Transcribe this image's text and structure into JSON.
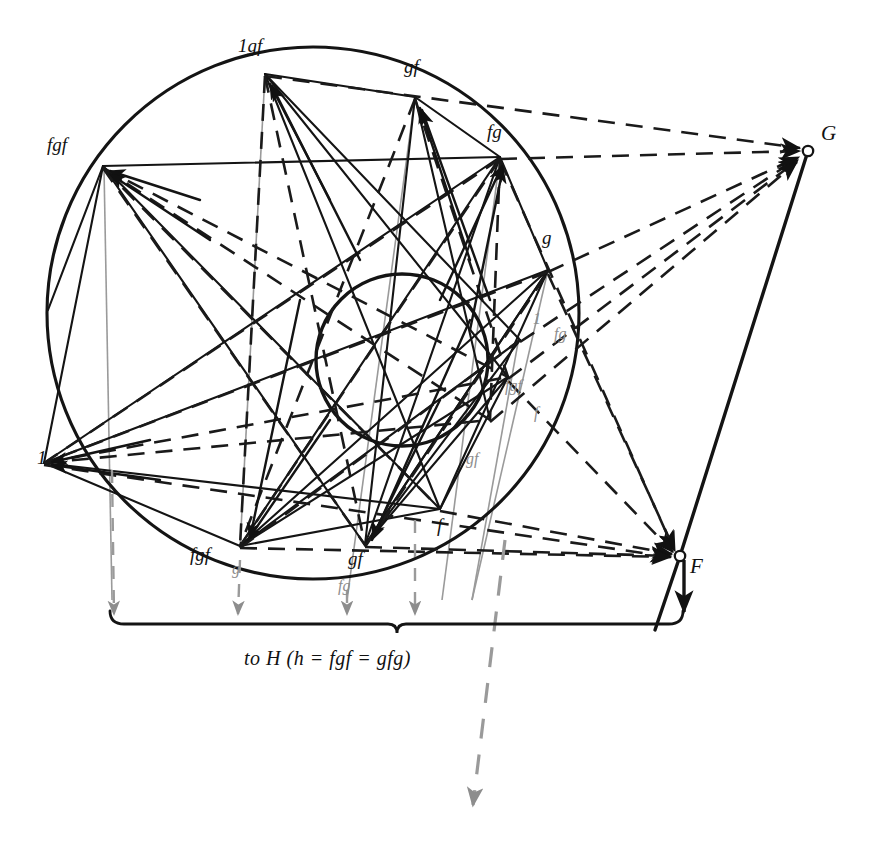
{
  "figure": {
    "type": "geometric-diagram",
    "background_color": "#ffffff",
    "ink_color": "#111111",
    "ghost_color": "#8d8d8d",
    "caption": "to H (h = fgf = gfg)"
  },
  "points": {
    "F": {
      "label": "F",
      "x": 680,
      "y": 556,
      "marker": "open-circle"
    },
    "G": {
      "label": "G",
      "x": 808,
      "y": 151,
      "marker": "open-circle"
    }
  },
  "outer_circle": {
    "cx": 313,
    "cy": 313,
    "r": 266
  },
  "inner_circle": {
    "cx": 402,
    "cy": 360,
    "r": 86
  },
  "vertex_labels": [
    {
      "id": "v-1gf",
      "text": "1gf",
      "x": 238,
      "y": 36,
      "color": "black",
      "size": 19
    },
    {
      "id": "v-gf-top",
      "text": "gf",
      "x": 404,
      "y": 57,
      "color": "black",
      "size": 19
    },
    {
      "id": "v-fg-right",
      "text": "fg",
      "x": 487,
      "y": 122,
      "color": "black",
      "size": 19
    },
    {
      "id": "v-fgf-left",
      "text": "fgf",
      "x": 47,
      "y": 135,
      "color": "black",
      "size": 19
    },
    {
      "id": "v-g-right",
      "text": "g",
      "x": 542,
      "y": 228,
      "color": "black",
      "size": 19
    },
    {
      "id": "v-1-left",
      "text": "1",
      "x": 37,
      "y": 448,
      "color": "black",
      "size": 19
    },
    {
      "id": "v-f-lower",
      "text": "f",
      "x": 437,
      "y": 516,
      "color": "black",
      "size": 19
    },
    {
      "id": "v-fgf-bot",
      "text": "fgf",
      "x": 190,
      "y": 545,
      "color": "black",
      "size": 19
    },
    {
      "id": "v-gf-bot",
      "text": "gf",
      "x": 348,
      "y": 549,
      "color": "black",
      "size": 19
    }
  ],
  "ghost_labels": [
    {
      "id": "g-1-inner",
      "text": "1",
      "x": 533,
      "y": 311,
      "color": "gray",
      "size": 16
    },
    {
      "id": "g-fg-inner",
      "text": "fg",
      "x": 554,
      "y": 326,
      "color": "gray",
      "size": 16
    },
    {
      "id": "g-fgf-inner",
      "text": "fgf",
      "x": 505,
      "y": 378,
      "color": "gray",
      "size": 16
    },
    {
      "id": "g-f-inner",
      "text": "f",
      "x": 534,
      "y": 405,
      "color": "gray",
      "size": 16
    },
    {
      "id": "g-gf-inner",
      "text": "gf",
      "x": 466,
      "y": 451,
      "color": "gray",
      "size": 16
    },
    {
      "id": "g-g-bot",
      "text": "g",
      "x": 232,
      "y": 561,
      "color": "gray",
      "size": 16
    },
    {
      "id": "g-fg-bot",
      "text": "fg",
      "x": 338,
      "y": 578,
      "color": "gray",
      "size": 16
    }
  ],
  "caption_label": {
    "text": "to H (h = fgf = gfg)",
    "x": 244,
    "y": 647,
    "size": 20
  },
  "brace": {
    "x_start": 110,
    "x_end": 683,
    "y": 623,
    "notch_x": 397
  },
  "projection_arrows": [
    {
      "id": "arrow-1",
      "x": 114,
      "y_tip": 618
    },
    {
      "id": "arrow-2",
      "x": 238,
      "y_tip": 618
    },
    {
      "id": "arrow-3",
      "x": 347,
      "y_tip": 618
    },
    {
      "id": "arrow-4",
      "x": 415,
      "y_tip": 618
    },
    {
      "id": "arrow-long",
      "x": 472,
      "y_tip": 815
    }
  ]
}
